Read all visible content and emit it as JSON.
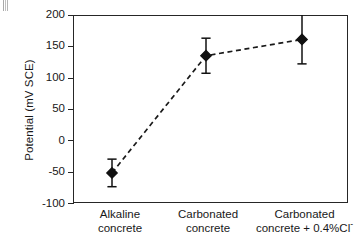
{
  "chart_data": {
    "type": "scatter",
    "title": "",
    "xlabel": "",
    "ylabel": "Potential (mV SCE)",
    "categories": [
      "Alkaline concrete",
      "Carbonated concrete",
      "Carbonated concrete + 0.4%Cl-"
    ],
    "category_lines": [
      [
        "Alkaline",
        "concrete"
      ],
      [
        "Carbonated",
        "concrete"
      ],
      [
        "Carbonated",
        "concrete + 0.4%Cl"
      ]
    ],
    "values": [
      -52,
      135,
      161
    ],
    "errors": [
      22,
      28,
      39
    ],
    "error_low": [
      -74,
      107,
      122
    ],
    "error_high": [
      -30,
      163,
      200
    ],
    "ylim": [
      -100,
      200
    ],
    "yticks": [
      200,
      150,
      100,
      50,
      0,
      -50,
      -100
    ],
    "ytick_labels": [
      "200",
      "150",
      "100",
      "50",
      "0",
      "-50",
      "-100"
    ],
    "grid": false,
    "legend": "none",
    "line_style": "dashed",
    "marker": "diamond",
    "marker_color": "#111111",
    "line_color": "#1a1a1a",
    "axis_color": "#262626"
  },
  "axis": {
    "y_title": "Potential (mV SCE)"
  },
  "superscript_minus": "-"
}
